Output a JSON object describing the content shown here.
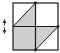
{
  "figure": {
    "colors": {
      "stroke": "#1a1a1a",
      "fill_shaded": "#cfcfcf",
      "background": "#ffffff",
      "arrow": "#333333"
    },
    "square": {
      "left": 13,
      "top": 3,
      "right": 58,
      "bottom": 50
    },
    "center": {
      "x": 35.5,
      "y": 26.5
    },
    "shaded_regions": [
      {
        "name": "top-left-triangle",
        "points": "13,26.5 35.5,3 35.5,26.5"
      },
      {
        "name": "bottom-left-square",
        "points": "13,26.5 35.5,26.5 35.5,50 13,50"
      },
      {
        "name": "bottom-right-triangle",
        "points": "35.5,26.5 58,26.5 35.5,50"
      }
    ],
    "dots": [
      {
        "name": "top-center-dot",
        "x": 35.5,
        "y": 3
      },
      {
        "name": "right-center-dot",
        "x": 58,
        "y": 26.5
      },
      {
        "name": "bottom-center-dot",
        "x": 35.5,
        "y": 50
      }
    ],
    "arrow": {
      "icon": "vertical-double-arrow-icon",
      "x": 4.5,
      "y1": 19,
      "y2": 34
    }
  }
}
